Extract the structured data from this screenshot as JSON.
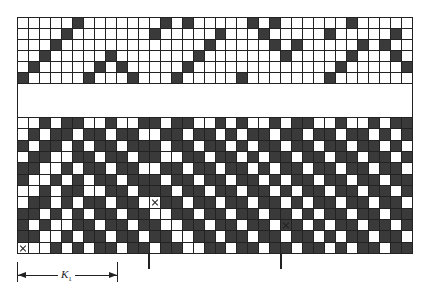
{
  "diagram": {
    "type": "weave-draft",
    "columns": 36,
    "cell_size_px": 11,
    "colors": {
      "filled": "#3a3a3a",
      "empty": "#ffffff",
      "line": "#222222"
    },
    "top_grid": {
      "rows": 6,
      "pattern": [
        "000001000000010100000101000000100000",
        "000010000000100000100010000010000010",
        "000100000000000001000001010000010100",
        "001000001000000010000000100000100010",
        "010000010100000100000000000001000001",
        "100000100010001000001000000010000000"
      ]
    },
    "bottom_grid": {
      "rows": 12,
      "pattern": [
        "001011001001101100101001011001001011",
        "010110110110011011010110110110110101",
        "101101011011101101101011011011011010",
        "011001101101100110110101101101101101",
        "110010110110011011011010110110110110",
        "100101011011101101101101011011011011",
        "001011001101110110110110101101101101",
        "011010110110011011011011010110110110",
        "110101011011001101101101101011011011",
        "101001101101100110110110110101101101",
        "110010110110110011011011011010110110",
        "000101011011011001101101101101011011"
      ],
      "markers": [
        {
          "symbol": "x",
          "row": 11,
          "col": 0
        },
        {
          "symbol": "x",
          "row": 7,
          "col": 12
        },
        {
          "symbol": "x",
          "row": 9,
          "col": 24
        }
      ]
    },
    "tick_marks_at_columns": [
      12,
      24
    ],
    "dimension": {
      "label": "K",
      "subscript": "1",
      "from_col": 0,
      "to_col": 9
    }
  }
}
